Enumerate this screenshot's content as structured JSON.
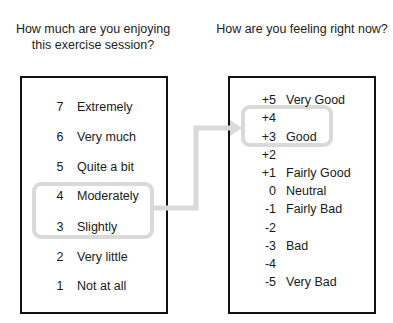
{
  "left_panel": {
    "title": "How much are you enjoying this exercise session?",
    "items": [
      {
        "value": "7",
        "label": "Extremely"
      },
      {
        "value": "6",
        "label": "Very much"
      },
      {
        "value": "5",
        "label": "Quite a bit"
      },
      {
        "value": "4",
        "label": "Moderately"
      },
      {
        "value": "3",
        "label": "Slightly"
      },
      {
        "value": "2",
        "label": "Very little"
      },
      {
        "value": "1",
        "label": "Not at all"
      }
    ],
    "highlighted_values": [
      "4",
      "3"
    ]
  },
  "right_panel": {
    "title": "How are you feeling right now?",
    "items": [
      {
        "value": "+5",
        "label": "Very Good"
      },
      {
        "value": "+4",
        "label": ""
      },
      {
        "value": "+3",
        "label": "Good"
      },
      {
        "value": "+2",
        "label": ""
      },
      {
        "value": "+1",
        "label": "Fairly Good"
      },
      {
        "value": "0",
        "label": "Neutral"
      },
      {
        "value": "-1",
        "label": "Fairly Bad"
      },
      {
        "value": "-2",
        "label": ""
      },
      {
        "value": "-3",
        "label": "Bad"
      },
      {
        "value": "-4",
        "label": ""
      },
      {
        "value": "-5",
        "label": "Very Bad"
      }
    ],
    "highlighted_values": [
      "+4",
      "+3"
    ]
  },
  "colors": {
    "border": "#111111",
    "highlight": "#d9d9d9",
    "text": "#1a1a1a"
  }
}
